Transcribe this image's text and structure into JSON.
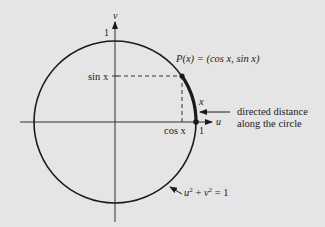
{
  "diagram": {
    "type": "unit-circle",
    "colors": {
      "background": "#e5e5e5",
      "stroke": "#1a1a1a",
      "axis": "#333333"
    },
    "axes": {
      "x_label": "u",
      "y_label": "v",
      "x_tick": "1",
      "y_tick": "1"
    },
    "point_label": "P(x) = (cos x, sin x)",
    "sin_label": "sin x",
    "cos_label": "cos x",
    "arc_label": "x",
    "annotation": {
      "line1": "directed distance",
      "line2": "along the circle"
    },
    "equation": {
      "base_u": "u",
      "base_v": "v",
      "exp": "2",
      "plus": " + ",
      "rhs": " = 1"
    }
  }
}
